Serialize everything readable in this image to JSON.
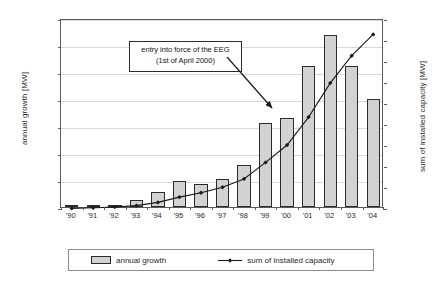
{
  "chart_data": {
    "type": "bar",
    "title": "",
    "categories": [
      "'90",
      "'91",
      "'92",
      "'93",
      "'94",
      "'95",
      "'96",
      "'97",
      "'98",
      "'99",
      "'00",
      "'01",
      "'02",
      "'03",
      "'04"
    ],
    "series": [
      {
        "name": "annual growth",
        "axis": "left",
        "kind": "bar",
        "values": [
          2,
          20,
          38,
          130,
          275,
          480,
          435,
          525,
          780,
          1550,
          1645,
          2615,
          3180,
          2615,
          1995
        ]
      },
      {
        "name": "sum of installed capacity",
        "axis": "right",
        "kind": "line",
        "values": [
          55,
          115,
          180,
          325,
          625,
          1130,
          1550,
          2080,
          2870,
          4440,
          6100,
          8750,
          11990,
          14600,
          16630
        ]
      }
    ],
    "xlabel": "",
    "ylabel": "annual growth [MW]",
    "y2label": "sum of installed capacity [MW]",
    "ylim": [
      0,
      3500
    ],
    "y2lim": [
      0,
      18000
    ],
    "yticks": [
      "0",
      "500",
      "1,000",
      "1,500",
      "2,000",
      "2,500",
      "3,000",
      "3,500"
    ],
    "ytick_values": [
      0,
      500,
      1000,
      1500,
      2000,
      2500,
      3000,
      3500
    ],
    "y2ticks": [
      "0",
      "2,000",
      "4,000",
      "6,000",
      "8,000",
      "10,000",
      "12,000",
      "14,000",
      "16,000",
      "18,000"
    ],
    "y2tick_values": [
      0,
      2000,
      4000,
      6000,
      8000,
      10000,
      12000,
      14000,
      16000,
      18000
    ],
    "grid": true,
    "legend_position": "bottom",
    "annotations": [
      {
        "line1": "entry into force of the EEG",
        "line2": "(1st of April 2000)",
        "points_to": "'00"
      }
    ]
  },
  "legend": {
    "bars_label": "annual growth",
    "line_label": "sum of installed capacity"
  },
  "colors": {
    "bar_fill": "#d2d2d2",
    "bar_edge": "#2b2b2b",
    "line": "#1a1a1a",
    "grid": "#d9d9d9",
    "frame": "#5a5a5a",
    "text": "#1f1f1f"
  }
}
